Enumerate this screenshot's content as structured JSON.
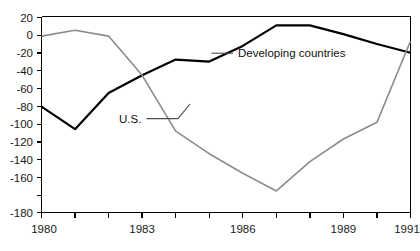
{
  "chart_data": {
    "type": "line",
    "title": "",
    "subtitle": "",
    "xlabel": "",
    "ylabel": "",
    "xlim": [
      1980,
      1991
    ],
    "ylim": [
      -180,
      20
    ],
    "grid": false,
    "legend_position": "inline-annotations",
    "x": [
      1980,
      1981,
      1982,
      1983,
      1984,
      1985,
      1986,
      1987,
      1988,
      1989,
      1990,
      1991
    ],
    "xticks": [
      1980,
      1981,
      1982,
      1983,
      1984,
      1985,
      1986,
      1987,
      1988,
      1989,
      1990,
      1991
    ],
    "xtick_labels": [
      "1980",
      "",
      "",
      "1983",
      "",
      "",
      "1986",
      "",
      "",
      "1989",
      "",
      "1991"
    ],
    "yticks": [
      20,
      0,
      -20,
      -40,
      -60,
      -80,
      -100,
      -120,
      -140,
      -160,
      -180
    ],
    "ytick_labels": [
      "20",
      "0",
      "-20",
      "-40",
      "-60",
      "-80",
      "-100",
      "-120",
      "-140",
      "-160",
      "-180"
    ],
    "series": [
      {
        "name": "Developing countries",
        "color": "#000000",
        "width": 2.2,
        "label_text": "Developing countries",
        "values": [
          -72,
          -95,
          -58,
          -40,
          -24,
          -26,
          -10,
          11,
          11,
          2,
          -8,
          -17
        ]
      },
      {
        "name": "U.S.",
        "color": "#8c8c8c",
        "width": 1.6,
        "label_text": "U.S.",
        "values": [
          0,
          6,
          0,
          -40,
          -97,
          -120,
          -140,
          -158,
          -128,
          -105,
          -88,
          -5
        ]
      }
    ],
    "annotations": [
      {
        "text": "Developing countries",
        "x": 1991,
        "y": -15
      },
      {
        "text": "U.S.",
        "x": 1983,
        "y": -83
      }
    ]
  },
  "labels": {
    "developing_countries": "Developing countries",
    "us": "U.S.",
    "y": {
      "t20": "20",
      "t0": "0",
      "tm20": "-20",
      "tm40": "-40",
      "tm60": "-60",
      "tm80": "-80",
      "tm100": "-100",
      "tm120": "-120",
      "tm140": "-140",
      "tm160": "-160",
      "tm180": "-180"
    },
    "x": {
      "y1980": "1980",
      "y1983": "1983",
      "y1986": "1986",
      "y1989": "1989",
      "y1991": "1991"
    }
  }
}
